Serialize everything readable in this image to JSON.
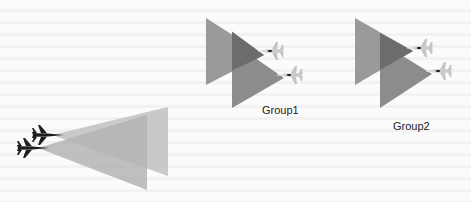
{
  "diagram": {
    "colors": {
      "cone_back": "#9a9a9a",
      "cone_front": "#8a8a8a",
      "cone_overlap": "#6c6c6c",
      "cone_light_back": "#c9c9c9",
      "cone_light_front": "#b4b4b4",
      "plane_light": "#c8c8c8",
      "plane_dark": "#1e1e1e",
      "label": "#222222"
    },
    "groups": [
      {
        "id": "group1",
        "label": "Group1",
        "aircraft_count": 2,
        "plane_color": "light"
      },
      {
        "id": "group2",
        "label": "Group2",
        "aircraft_count": 2,
        "plane_color": "light"
      },
      {
        "id": "formation",
        "label": "",
        "aircraft_count": 2,
        "plane_color": "dark"
      }
    ]
  }
}
